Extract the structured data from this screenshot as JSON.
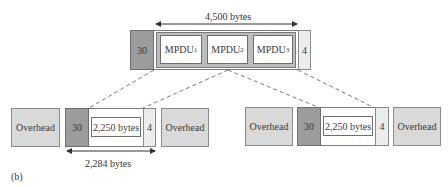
{
  "figure_label": "(b)",
  "top_frame": {
    "header": "30",
    "trailer": "4",
    "span_label": "4,500 bytes",
    "mpdus": [
      {
        "label": "MPDU",
        "sub": "1"
      },
      {
        "label": "MPDU",
        "sub": "2"
      },
      {
        "label": "MPDU",
        "sub": "3"
      }
    ]
  },
  "left_group": {
    "overhead_left": "Overhead",
    "header": "30",
    "payload": "2,250 bytes",
    "trailer": "4",
    "overhead_right": "Overhead",
    "span_label": "2,284 bytes"
  },
  "right_group": {
    "overhead_left": "Overhead",
    "header": "30",
    "payload": "2,250 bytes",
    "trailer": "4",
    "overhead_right": "Overhead"
  },
  "colors": {
    "header_fill": "#9c9c9c",
    "overhead_fill": "#d9d9d9",
    "trailer_fill": "#ececec",
    "mpdu_container_fill": "#bdbdbd"
  }
}
